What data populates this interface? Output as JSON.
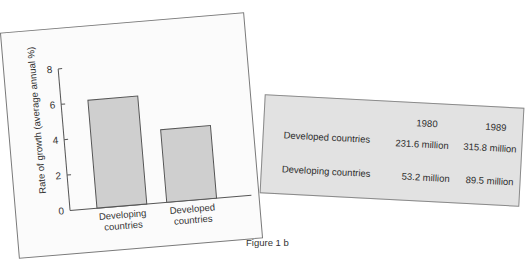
{
  "figure_1a": {
    "caption": "Figure 1a",
    "table": {
      "columns": [
        "",
        "1980",
        "1989"
      ],
      "rows": [
        {
          "label": "Developed countries",
          "values": [
            "231.6 million",
            "315.8 million"
          ]
        },
        {
          "label": "Developing countries",
          "values": [
            "53.2 million",
            "89.5 million"
          ]
        }
      ]
    }
  },
  "figure_1b": {
    "caption": "Figure 1 b"
  },
  "chart_data": {
    "type": "bar",
    "title": "",
    "categories": [
      "Developing countries",
      "Developed countries"
    ],
    "category_lines": [
      [
        "Developing",
        "countries"
      ],
      [
        "Developed",
        "countries"
      ]
    ],
    "values": [
      6.1,
      4.1
    ],
    "xlabel": "",
    "ylabel": "Rate of growth (average annual %)",
    "ylim": [
      0,
      8
    ],
    "yticks": [
      0,
      2,
      4,
      6,
      8
    ],
    "grid": false,
    "bar_color": "#cfcfcf",
    "edge_color": "#555555"
  }
}
